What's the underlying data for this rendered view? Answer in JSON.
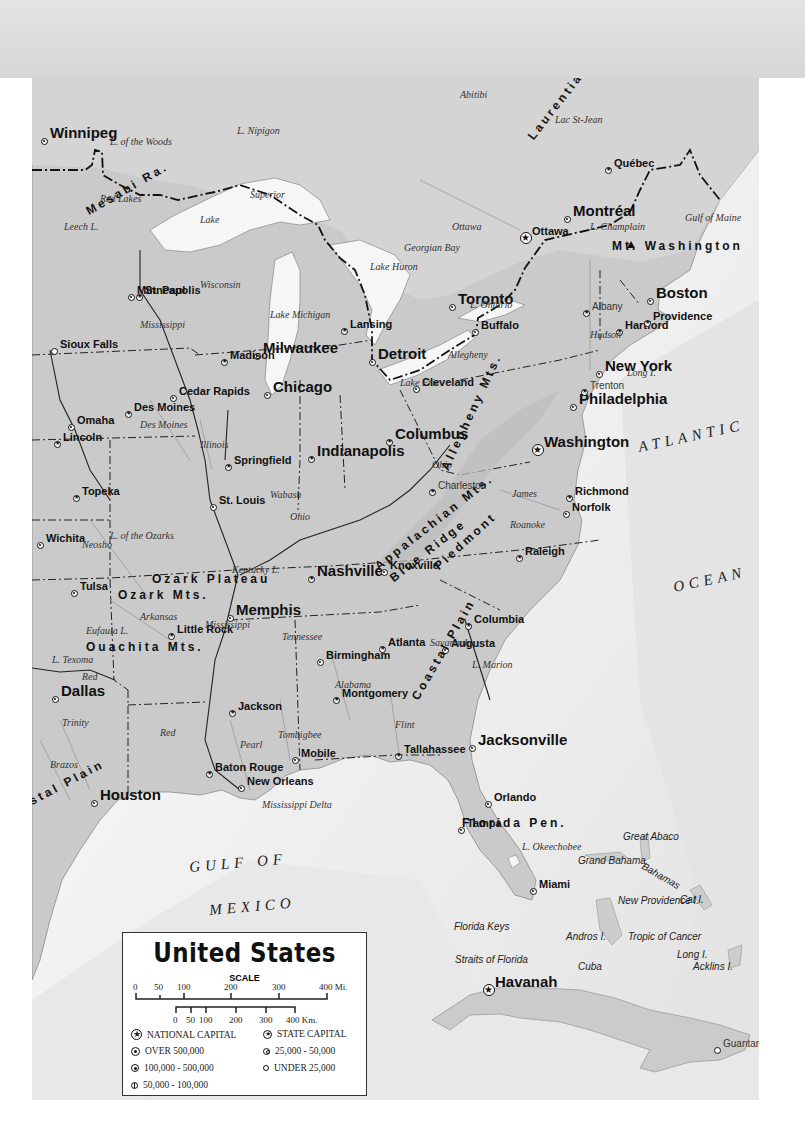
{
  "map": {
    "title": "United States",
    "subject": "Eastern United States physical-political map",
    "colors": {
      "header_band": "#dcdcdc",
      "land": "#c9c9c9",
      "land_canada": "#d2d2d2",
      "water": "#ffffff",
      "deep_water": "#e6e6e6",
      "border": "#111111",
      "river": "#9a9a9a"
    },
    "cities": [
      {
        "name": "Winnipeg",
        "x": 44,
        "y": 141,
        "size": "big",
        "marker": "over-500k"
      },
      {
        "name": "Minneapolis",
        "x": 131,
        "y": 297,
        "size": "med",
        "marker": "over-500k"
      },
      {
        "name": "St. Paul",
        "x": 139,
        "y": 297,
        "size": "med",
        "marker": "state-capital"
      },
      {
        "name": "Sioux Falls",
        "x": 54,
        "y": 351,
        "size": "med",
        "marker": "50k-100k"
      },
      {
        "name": "Milwaukee",
        "x": 257,
        "y": 356,
        "size": "big",
        "marker": "over-500k"
      },
      {
        "name": "Madison",
        "x": 224,
        "y": 362,
        "size": "med",
        "marker": "state-capital"
      },
      {
        "name": "Lansing",
        "x": 344,
        "y": 331,
        "size": "med",
        "marker": "state-capital"
      },
      {
        "name": "Detroit",
        "x": 372,
        "y": 362,
        "size": "big",
        "marker": "over-500k"
      },
      {
        "name": "Toronto",
        "x": 452,
        "y": 307,
        "size": "big",
        "marker": "over-500k"
      },
      {
        "name": "Buffalo",
        "x": 475,
        "y": 332,
        "size": "med",
        "marker": "100k-500k"
      },
      {
        "name": "Chicago",
        "x": 267,
        "y": 395,
        "size": "big",
        "marker": "over-500k"
      },
      {
        "name": "Cedar Rapids",
        "x": 173,
        "y": 398,
        "size": "med",
        "marker": "100k-500k"
      },
      {
        "name": "Des Moines",
        "x": 128,
        "y": 414,
        "size": "med",
        "marker": "state-capital"
      },
      {
        "name": "Omaha",
        "x": 71,
        "y": 427,
        "size": "med",
        "marker": "over-500k"
      },
      {
        "name": "Lincoln",
        "x": 57,
        "y": 444,
        "size": "med",
        "marker": "state-capital"
      },
      {
        "name": "Cleveland",
        "x": 416,
        "y": 389,
        "size": "med",
        "marker": "over-500k"
      },
      {
        "name": "Indianapolis",
        "x": 311,
        "y": 459,
        "size": "big",
        "marker": "state-capital"
      },
      {
        "name": "Columbus",
        "x": 389,
        "y": 442,
        "size": "big",
        "marker": "state-capital"
      },
      {
        "name": "Springfield",
        "x": 228,
        "y": 467,
        "size": "med",
        "marker": "state-capital"
      },
      {
        "name": "St. Louis",
        "x": 213,
        "y": 507,
        "size": "med",
        "marker": "over-500k"
      },
      {
        "name": "Topeka",
        "x": 76,
        "y": 498,
        "size": "med",
        "marker": "state-capital"
      },
      {
        "name": "Wichita",
        "x": 40,
        "y": 545,
        "size": "med",
        "marker": "100k-500k"
      },
      {
        "name": "Tulsa",
        "x": 74,
        "y": 593,
        "size": "med",
        "marker": "100k-500k"
      },
      {
        "name": "Charleston",
        "x": 432,
        "y": 492,
        "size": "sm",
        "marker": "state-capital"
      },
      {
        "name": "Richmond",
        "x": 569,
        "y": 498,
        "size": "med",
        "marker": "state-capital"
      },
      {
        "name": "Norfolk",
        "x": 566,
        "y": 514,
        "size": "med",
        "marker": "100k-500k"
      },
      {
        "name": "Washington",
        "x": 538,
        "y": 450,
        "size": "big",
        "marker": "national-capital"
      },
      {
        "name": "Philadelphia",
        "x": 573,
        "y": 407,
        "size": "big",
        "marker": "over-500k"
      },
      {
        "name": "Trenton",
        "x": 584,
        "y": 392,
        "size": "sm",
        "marker": "state-capital"
      },
      {
        "name": "New York",
        "x": 599,
        "y": 374,
        "size": "big",
        "marker": "over-500k"
      },
      {
        "name": "Hartford",
        "x": 619,
        "y": 332,
        "size": "med",
        "marker": "state-capital"
      },
      {
        "name": "Providence",
        "x": 647,
        "y": 323,
        "size": "med",
        "marker": "state-capital"
      },
      {
        "name": "Boston",
        "x": 650,
        "y": 301,
        "size": "big",
        "marker": "over-500k"
      },
      {
        "name": "Albany",
        "x": 586,
        "y": 313,
        "size": "sm",
        "marker": "state-capital"
      },
      {
        "name": "Ottawa",
        "x": 526,
        "y": 238,
        "size": "med",
        "marker": "national-capital"
      },
      {
        "name": "Montréal",
        "x": 567,
        "y": 219,
        "size": "big",
        "marker": "over-500k"
      },
      {
        "name": "Québec",
        "x": 608,
        "y": 170,
        "size": "med",
        "marker": "state-capital"
      },
      {
        "name": "Nashville",
        "x": 311,
        "y": 579,
        "size": "big",
        "marker": "state-capital"
      },
      {
        "name": "Knoxville",
        "x": 384,
        "y": 572,
        "size": "med",
        "marker": "100k-500k"
      },
      {
        "name": "Raleigh",
        "x": 519,
        "y": 558,
        "size": "med",
        "marker": "state-capital"
      },
      {
        "name": "Memphis",
        "x": 230,
        "y": 618,
        "size": "big",
        "marker": "over-500k"
      },
      {
        "name": "Little Rock",
        "x": 171,
        "y": 636,
        "size": "med",
        "marker": "state-capital"
      },
      {
        "name": "Columbia",
        "x": 468,
        "y": 626,
        "size": "med",
        "marker": "state-capital"
      },
      {
        "name": "Birmingham",
        "x": 320,
        "y": 662,
        "size": "med",
        "marker": "100k-500k"
      },
      {
        "name": "Atlanta",
        "x": 382,
        "y": 649,
        "size": "med",
        "marker": "state-capital"
      },
      {
        "name": "Augusta",
        "x": 445,
        "y": 650,
        "size": "med",
        "marker": "100k-500k"
      },
      {
        "name": "Dallas",
        "x": 55,
        "y": 699,
        "size": "big",
        "marker": "over-500k"
      },
      {
        "name": "Jackson",
        "x": 232,
        "y": 713,
        "size": "med",
        "marker": "state-capital"
      },
      {
        "name": "Montgomery",
        "x": 336,
        "y": 700,
        "size": "med",
        "marker": "state-capital"
      },
      {
        "name": "Mobile",
        "x": 295,
        "y": 760,
        "size": "med",
        "marker": "100k-500k"
      },
      {
        "name": "Tallahassee",
        "x": 398,
        "y": 756,
        "size": "med",
        "marker": "state-capital"
      },
      {
        "name": "Jacksonville",
        "x": 472,
        "y": 748,
        "size": "big",
        "marker": "over-500k"
      },
      {
        "name": "Baton Rouge",
        "x": 209,
        "y": 774,
        "size": "med",
        "marker": "state-capital"
      },
      {
        "name": "New Orleans",
        "x": 241,
        "y": 788,
        "size": "med",
        "marker": "over-500k"
      },
      {
        "name": "Houston",
        "x": 94,
        "y": 803,
        "size": "big",
        "marker": "over-500k"
      },
      {
        "name": "Orlando",
        "x": 488,
        "y": 804,
        "size": "med",
        "marker": "100k-500k"
      },
      {
        "name": "Tampa",
        "x": 461,
        "y": 830,
        "size": "med",
        "marker": "100k-500k"
      },
      {
        "name": "Miami",
        "x": 533,
        "y": 891,
        "size": "med",
        "marker": "over-500k"
      },
      {
        "name": "Havanah",
        "x": 489,
        "y": 990,
        "size": "big",
        "marker": "national-capital"
      },
      {
        "name": "Guantanamo",
        "x": 717,
        "y": 1050,
        "size": "sm",
        "marker": "50k-100k"
      }
    ],
    "labels": {
      "waters": [
        {
          "text": "L. Nipigon",
          "x": 237,
          "y": 126
        },
        {
          "text": "L. of the Woods",
          "x": 110,
          "y": 137
        },
        {
          "text": "Red Lakes",
          "x": 100,
          "y": 194
        },
        {
          "text": "Leech L.",
          "x": 64,
          "y": 222
        },
        {
          "text": "Lake",
          "x": 200,
          "y": 215
        },
        {
          "text": "Superior",
          "x": 250,
          "y": 190
        },
        {
          "text": "Lake Michigan",
          "x": 270,
          "y": 310
        },
        {
          "text": "Lake Huron",
          "x": 370,
          "y": 262
        },
        {
          "text": "Georgian Bay",
          "x": 404,
          "y": 243
        },
        {
          "text": "L. Ontario",
          "x": 470,
          "y": 300
        },
        {
          "text": "Lake Erie",
          "x": 400,
          "y": 378
        },
        {
          "text": "L. Champlain",
          "x": 590,
          "y": 222
        },
        {
          "text": "Ottawa",
          "x": 452,
          "y": 222
        },
        {
          "text": "Abitibi",
          "x": 460,
          "y": 90
        },
        {
          "text": "Lac St-Jean",
          "x": 555,
          "y": 115
        },
        {
          "text": "Mississippi",
          "x": 140,
          "y": 320
        },
        {
          "text": "Wisconsin",
          "x": 200,
          "y": 280
        },
        {
          "text": "Des Moines",
          "x": 140,
          "y": 420
        },
        {
          "text": "Illinois",
          "x": 200,
          "y": 440
        },
        {
          "text": "Wabash",
          "x": 270,
          "y": 490
        },
        {
          "text": "Ohio",
          "x": 290,
          "y": 512
        },
        {
          "text": "Ohio",
          "x": 432,
          "y": 460
        },
        {
          "text": "Allegheny",
          "x": 448,
          "y": 350
        },
        {
          "text": "Hudson",
          "x": 590,
          "y": 330
        },
        {
          "text": "James",
          "x": 512,
          "y": 489
        },
        {
          "text": "Roanoke",
          "x": 510,
          "y": 520
        },
        {
          "text": "L. of the Ozarks",
          "x": 110,
          "y": 531
        },
        {
          "text": "Neosho",
          "x": 82,
          "y": 540
        },
        {
          "text": "Kentucky L.",
          "x": 232,
          "y": 565
        },
        {
          "text": "Arkansas",
          "x": 140,
          "y": 612
        },
        {
          "text": "Mississippi",
          "x": 205,
          "y": 620
        },
        {
          "text": "Tennessee",
          "x": 282,
          "y": 632
        },
        {
          "text": "Eufaula L.",
          "x": 86,
          "y": 626
        },
        {
          "text": "L. Texoma",
          "x": 52,
          "y": 655
        },
        {
          "text": "Red",
          "x": 82,
          "y": 672
        },
        {
          "text": "Alabama",
          "x": 335,
          "y": 680
        },
        {
          "text": "Savannah",
          "x": 430,
          "y": 638
        },
        {
          "text": "L. Marion",
          "x": 472,
          "y": 660
        },
        {
          "text": "Trinity",
          "x": 62,
          "y": 718
        },
        {
          "text": "Brazos",
          "x": 50,
          "y": 760
        },
        {
          "text": "Red",
          "x": 160,
          "y": 728
        },
        {
          "text": "Pearl",
          "x": 240,
          "y": 740
        },
        {
          "text": "Tombigbee",
          "x": 278,
          "y": 730
        },
        {
          "text": "Flint",
          "x": 395,
          "y": 720
        },
        {
          "text": "Mississippi Delta",
          "x": 262,
          "y": 800
        },
        {
          "text": "L. Okeechobee",
          "x": 522,
          "y": 842
        },
        {
          "text": "Gulf of Maine",
          "x": 685,
          "y": 213
        },
        {
          "text": "Long I.",
          "x": 627,
          "y": 368
        }
      ],
      "regions": [
        {
          "text": "Mesabi Ra.",
          "x": 90,
          "y": 205,
          "rotate": -30
        },
        {
          "text": "Laurentian Mts.",
          "x": 535,
          "y": 130,
          "rotate": -52
        },
        {
          "text": "Allegheny Mts.",
          "x": 450,
          "y": 460,
          "rotate": -65
        },
        {
          "text": "Appalachian Mts.",
          "x": 380,
          "y": 560,
          "rotate": -38
        },
        {
          "text": "Blue Ridge",
          "x": 395,
          "y": 572,
          "rotate": -38
        },
        {
          "text": "Piedmont",
          "x": 440,
          "y": 560,
          "rotate": -42
        },
        {
          "text": "Coastal Plain",
          "x": 420,
          "y": 690,
          "rotate": -60
        },
        {
          "text": "Coastal Plain",
          "x": 5,
          "y": 810,
          "rotate": -28
        },
        {
          "text": "Ozark Plateau",
          "x": 152,
          "y": 573
        },
        {
          "text": "Ozark Mts.",
          "x": 118,
          "y": 589
        },
        {
          "text": "Ouachita Mts.",
          "x": 86,
          "y": 641
        },
        {
          "text": "Mt. Washington",
          "x": 612,
          "y": 240
        },
        {
          "text": "Florida Pen.",
          "x": 462,
          "y": 817
        }
      ],
      "oceans": [
        {
          "text": "ATLANTIC",
          "x": 640,
          "y": 440,
          "rotate": -12
        },
        {
          "text": "OCEAN",
          "x": 675,
          "y": 580,
          "rotate": -12
        },
        {
          "text": "GULF OF",
          "x": 190,
          "y": 860,
          "rotate": -5
        },
        {
          "text": "MEXICO",
          "x": 210,
          "y": 903,
          "rotate": -5
        }
      ],
      "islands": [
        {
          "text": "Great Abaco",
          "x": 623,
          "y": 832
        },
        {
          "text": "Grand Bahama",
          "x": 578,
          "y": 856
        },
        {
          "text": "Bahamas",
          "x": 640,
          "y": 860,
          "rotate": 30
        },
        {
          "text": "New Providence I.",
          "x": 618,
          "y": 896
        },
        {
          "text": "Cat I.",
          "x": 680,
          "y": 895
        },
        {
          "text": "Andros I.",
          "x": 566,
          "y": 932
        },
        {
          "text": "Tropic of Cancer",
          "x": 628,
          "y": 932
        },
        {
          "text": "Long I.",
          "x": 677,
          "y": 950
        },
        {
          "text": "Acklins I.",
          "x": 693,
          "y": 962
        },
        {
          "text": "Florida Keys",
          "x": 454,
          "y": 922
        },
        {
          "text": "Straits of Florida",
          "x": 455,
          "y": 955
        },
        {
          "text": "Cuba",
          "x": 578,
          "y": 962
        }
      ]
    },
    "legend": {
      "title": "United States",
      "scale_title": "SCALE",
      "miles_ticks": [
        "0",
        "50",
        "100",
        "200",
        "300",
        "400 Mi."
      ],
      "km_ticks": [
        "0",
        "50",
        "100",
        "200",
        "300",
        "400 Km."
      ],
      "items": [
        {
          "symbol": "national-capital",
          "label": "NATIONAL CAPITAL"
        },
        {
          "symbol": "state-capital",
          "label": "STATE CAPITAL"
        },
        {
          "symbol": "over-500k",
          "label": "OVER 500,000"
        },
        {
          "symbol": "25k-50k",
          "label": "25,000 - 50,000"
        },
        {
          "symbol": "100k-500k",
          "label": "100,000 - 500,000"
        },
        {
          "symbol": "under-25k",
          "label": "UNDER 25,000"
        },
        {
          "symbol": "50k-100k",
          "label": "50,000 - 100,000"
        }
      ]
    }
  }
}
